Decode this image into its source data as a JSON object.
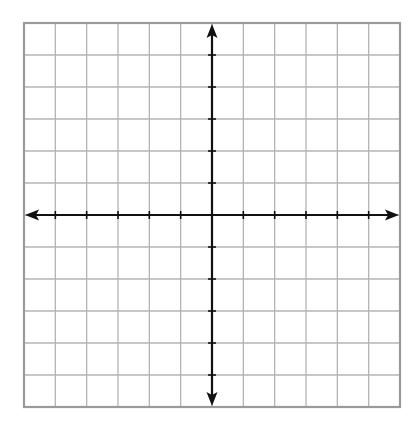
{
  "diagram": {
    "type": "coordinate-plane",
    "grid": {
      "columns": 12,
      "rows": 12,
      "left": 24,
      "top": 23,
      "right": 400,
      "bottom": 407,
      "line_color": "#b4b4b4",
      "border_color": "#9a9a9a"
    },
    "axes": {
      "x_axis_row": 6,
      "y_axis_col": 6,
      "color": "#111111",
      "arrows": [
        "left",
        "right",
        "up",
        "down"
      ],
      "tick_marks": true,
      "labels": []
    }
  }
}
